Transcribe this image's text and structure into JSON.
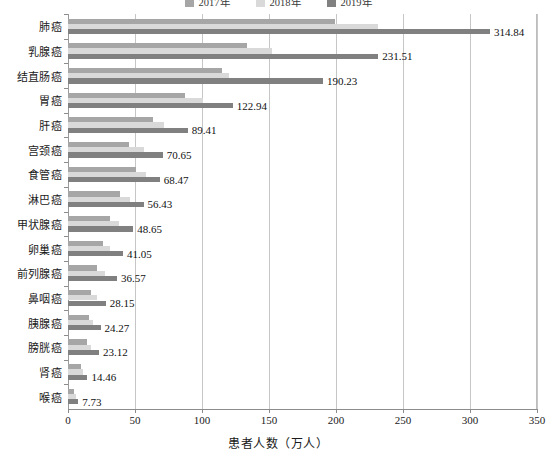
{
  "chart_data": {
    "type": "bar",
    "orientation": "horizontal",
    "title": "",
    "xlabel": "患者人数（万人）",
    "ylabel": "",
    "xlim": [
      0,
      350
    ],
    "xticks": [
      0,
      50,
      100,
      150,
      200,
      250,
      300,
      350
    ],
    "grid": true,
    "legend_position": "top-center",
    "categories": [
      "肺癌",
      "乳腺癌",
      "结直肠癌",
      "胃癌",
      "肝癌",
      "宫颈癌",
      "食管癌",
      "淋巴癌",
      "甲状腺癌",
      "卵巢癌",
      "前列腺癌",
      "鼻咽癌",
      "胰腺癌",
      "膀胱癌",
      "肾癌",
      "喉癌"
    ],
    "series": [
      {
        "name": "2017年",
        "color": "#a6a6a6",
        "values": [
          199.5,
          133.8,
          115.0,
          87.0,
          63.5,
          45.5,
          51.0,
          39.0,
          31.0,
          26.0,
          21.5,
          17.5,
          15.5,
          14.0,
          9.5,
          4.6
        ]
      },
      {
        "name": "2018年",
        "color": "#d9d9d9",
        "values": [
          231.5,
          152.0,
          120.0,
          100.5,
          72.0,
          57.0,
          58.0,
          46.0,
          38.0,
          31.0,
          27.5,
          21.5,
          19.0,
          17.5,
          11.5,
          5.9
        ]
      },
      {
        "name": "2019年",
        "color": "#808080",
        "values": [
          314.84,
          231.51,
          190.23,
          122.94,
          89.41,
          70.65,
          68.47,
          56.43,
          48.65,
          41.05,
          36.57,
          28.15,
          24.27,
          23.12,
          14.46,
          7.73
        ]
      }
    ],
    "value_labels": [
      "314.84",
      "231.51",
      "190.23",
      "122.94",
      "89.41",
      "70.65",
      "68.47",
      "56.43",
      "48.65",
      "41.05",
      "36.57",
      "28.15",
      "24.27",
      "23.12",
      "14.46",
      "7.73"
    ],
    "value_label_series": "2019年"
  }
}
